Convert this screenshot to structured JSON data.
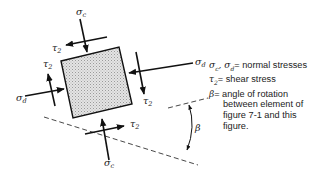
{
  "diagram": {
    "element": {
      "fill": "#d8d8d8",
      "stroke": "#111111"
    },
    "labels": {
      "sigma_c_top": {
        "base": "σ",
        "sub": "c"
      },
      "sigma_c_bottom": {
        "base": "σ",
        "sub": "c"
      },
      "sigma_d_left": {
        "base": "σ",
        "sub": "d"
      },
      "sigma_d_right": {
        "base": "σ",
        "sub": "d"
      },
      "tau2_top": {
        "base": "τ",
        "sub": "2"
      },
      "tau2_left": {
        "base": "τ",
        "sub": "2"
      },
      "tau2_right": {
        "base": "τ",
        "sub": "2"
      },
      "tau2_bottom": {
        "base": "τ",
        "sub": "2"
      },
      "beta": "β"
    }
  },
  "legend": {
    "row1": {
      "sym1": "σ",
      "sub1": "c",
      "sep": ", ",
      "sym2": "σ",
      "sub2": "d",
      "text": " = normal stresses"
    },
    "row2": {
      "sym": "τ",
      "sub": "2",
      "text": " = shear stress"
    },
    "row3": {
      "sym": "β",
      "text": " = angle of rotation"
    },
    "row3_cont": [
      "between element of",
      "figure 7-1 and this",
      "figure."
    ]
  }
}
